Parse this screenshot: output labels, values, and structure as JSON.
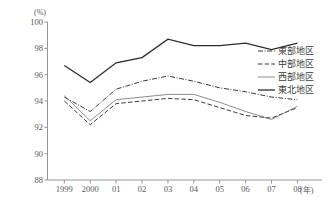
{
  "chart_data": {
    "type": "line",
    "title": "",
    "subtitle": "",
    "xlabel": "(年)",
    "ylabel": "(%)",
    "x": [
      "1999",
      "2000",
      "01",
      "02",
      "03",
      "04",
      "05",
      "06",
      "07",
      "08"
    ],
    "categories": [
      "1999",
      "2000",
      "01",
      "02",
      "03",
      "04",
      "05",
      "06",
      "07",
      "08"
    ],
    "xtick_labels": [
      "1999",
      "2000",
      "01",
      "02",
      "03",
      "04",
      "05",
      "06",
      "07",
      "08"
    ],
    "ytick_labels": [
      "88",
      "90",
      "92",
      "94",
      "96",
      "98",
      "100"
    ],
    "ytick_values": [
      88,
      90,
      92,
      94,
      96,
      98,
      100
    ],
    "ylim": [
      88,
      100
    ],
    "xlim": [
      0,
      9
    ],
    "grid": false,
    "legend_position": "right",
    "series": [
      {
        "name": "東部地区",
        "style": "dash-dot",
        "color": "#3a3a3a",
        "width": 1.0,
        "values": [
          94.3,
          93.2,
          94.9,
          95.5,
          95.9,
          95.5,
          95.0,
          94.7,
          94.3,
          94.1
        ]
      },
      {
        "name": "中部地区",
        "style": "dashed",
        "color": "#3a3a3a",
        "width": 1.0,
        "values": [
          94.0,
          92.2,
          93.8,
          94.0,
          94.2,
          94.1,
          93.5,
          92.9,
          92.7,
          93.5
        ]
      },
      {
        "name": "西部地区",
        "style": "solid-thin",
        "color": "#6e6e6e",
        "width": 0.8,
        "values": [
          94.4,
          92.5,
          94.1,
          94.3,
          94.5,
          94.5,
          93.9,
          93.2,
          92.6,
          93.6
        ]
      },
      {
        "name": "東北地区",
        "style": "solid-thick",
        "color": "#2b2b2b",
        "width": 1.3,
        "values": [
          96.7,
          95.4,
          96.9,
          97.3,
          98.7,
          98.2,
          98.2,
          98.4,
          97.9,
          98.4
        ]
      }
    ]
  },
  "legend": {
    "items": [
      {
        "label": "東部地区",
        "style": "dash-dot"
      },
      {
        "label": "中部地区",
        "style": "dashed"
      },
      {
        "label": "西部地区",
        "style": "solid-thin"
      },
      {
        "label": "東北地区",
        "style": "solid-thick"
      }
    ]
  },
  "axes": {
    "y_unit": "(%)",
    "x_unit": "(年)"
  }
}
